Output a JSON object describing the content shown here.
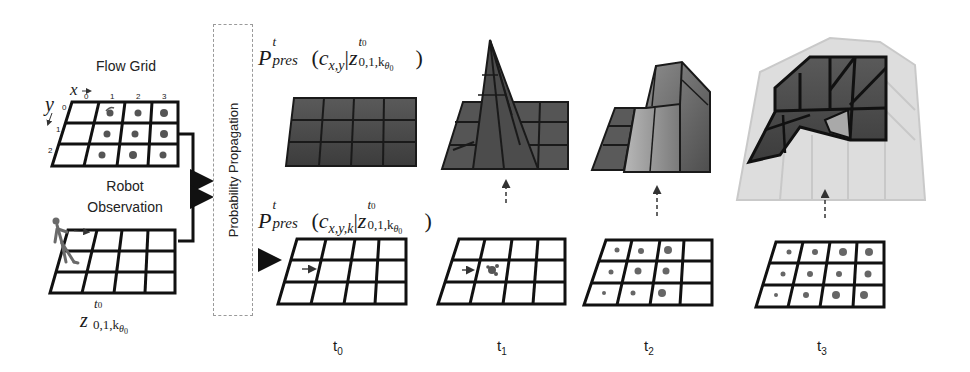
{
  "figure": {
    "flow_grid": {
      "title": "Flow Grid",
      "x_axis_label": "x",
      "y_axis_label": "y",
      "x_ticks": [
        "0",
        "1",
        "2",
        "3"
      ],
      "y_ticks": [
        "0",
        "1",
        "2"
      ]
    },
    "robot_observation": {
      "title_line1": "Robot",
      "title_line2": "Observation",
      "formula": "z^{t0}_{0,1,kθ0}",
      "formula_base": "z",
      "formula_sup": "t",
      "formula_sup_sub": "0",
      "formula_sub": "0,1,k",
      "formula_sub_theta": "θ",
      "formula_sub_theta_sub": "0"
    },
    "propagation_box": {
      "label": "Probability Propagation"
    },
    "top_formula": {
      "P": "P",
      "sup": "t",
      "sub": "pres",
      "open": "(",
      "c": "c",
      "c_sub": "x,y",
      "bar": "|",
      "z": "z",
      "close": ")"
    },
    "bottom_formula": {
      "P": "P",
      "sup": "t",
      "sub": "pres",
      "open": "(",
      "c": "c",
      "c_sub": "x,y,k",
      "bar": "|",
      "z": "z",
      "close": ")"
    },
    "z_sup": "t",
    "z_sup_sub": "0",
    "z_sub": "0,1,k",
    "z_sub_theta": "θ",
    "z_sub_theta_sub": "0",
    "timesteps": [
      {
        "label": "t",
        "sub": "0"
      },
      {
        "label": "t",
        "sub": "1"
      },
      {
        "label": "t",
        "sub": "2"
      },
      {
        "label": "t",
        "sub": "3"
      }
    ],
    "colors": {
      "grid_line": "#111111",
      "surface_dark": "#4a4a4a",
      "surface_mid": "#6e6e6e",
      "surface_light": "#a8a8a8",
      "surface_ghost": "#d8d8d8",
      "box_border": "#9a9a9a"
    }
  }
}
